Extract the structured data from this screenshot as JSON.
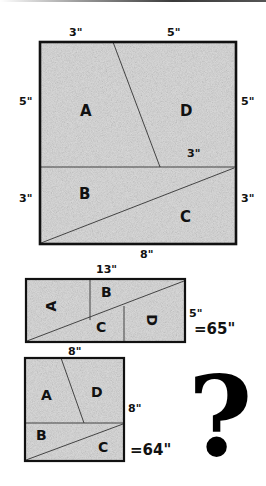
{
  "colors": {
    "fill": "#d9d9d9",
    "stroke": "#111111",
    "thin_line": "#333333"
  },
  "square_8x8_large": {
    "dims": {
      "top_left": "3\"",
      "top_right": "5\"",
      "left_upper": "5\"",
      "left_lower": "3\"",
      "right_upper": "5\"",
      "right_lower": "3\"",
      "inner_mid": "3\"",
      "bottom": "8\""
    },
    "pieces": [
      "A",
      "D",
      "B",
      "C"
    ]
  },
  "rectangle_13x5": {
    "dims": {
      "top": "13\"",
      "right": "5\"",
      "bottom": "8\""
    },
    "pieces": [
      "A",
      "B",
      "C",
      "D"
    ],
    "area_label": "=65\""
  },
  "square_8x8_small": {
    "dims": {
      "top": "8\"",
      "right": "8\""
    },
    "pieces": [
      "A",
      "D",
      "B",
      "C"
    ],
    "area_label": "=64\""
  },
  "question_mark": "?"
}
